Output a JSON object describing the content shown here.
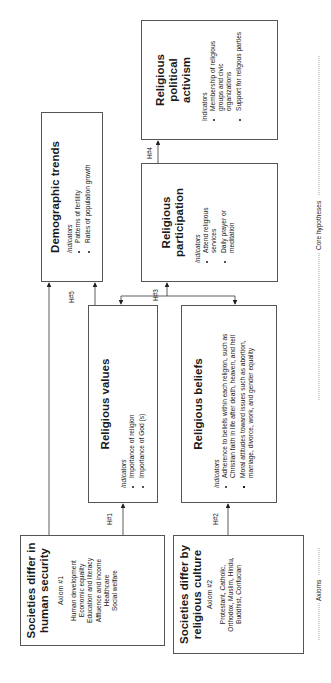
{
  "axioms": [
    {
      "id": "axiom-1",
      "title": "Societies differ in human security",
      "subtitle": "Axiom #1",
      "items": [
        "Human development",
        "Economic equality",
        "Education and literacy",
        "Affluence and income",
        "Healthcare",
        "Social welfare"
      ]
    },
    {
      "id": "axiom-2",
      "title": "Societies differ by religious culture",
      "subtitle": "Axiom #2",
      "items_text": "Protestant, Catholic, Orthodox, Muslim, Hindu, Buddhist, Confucian"
    }
  ],
  "boxes": {
    "religious_values": {
      "title": "Religious values",
      "indicators_label": "Indicators",
      "items": [
        "Importance of religion",
        "Importance of God (s)"
      ]
    },
    "religious_beliefs": {
      "title": "Religious beliefs",
      "indicators_label": "Indicators",
      "items": [
        "Adherence to beliefs within each religion, such as Christian faith in life after death, heaven, and hell",
        "Moral attitudes toward issues such as abortion, marriage, divorce, work, and gender equality"
      ]
    },
    "demographic_trends": {
      "title": "Demographic trends",
      "indicators_label": "Indicators",
      "items": [
        "Patterns of fertility",
        "Rates of population growth"
      ]
    },
    "religious_participation": {
      "title": "Religious participation",
      "indicators_label": "Indicators",
      "items": [
        "Attend religious services",
        "Daily prayer or meditation"
      ]
    },
    "religious_political_activism": {
      "title": "Religious political activism",
      "indicators_label": "Indicators",
      "items": [
        "Membership of religious groups and civic organizations",
        "Support for religous parties"
      ]
    }
  },
  "hypotheses": {
    "h1": "H#1",
    "h2": "H#2",
    "h3": "H#3",
    "h4": "H#4",
    "h5": "H#5"
  },
  "section_labels": {
    "axioms": "Axioms",
    "core_hypotheses": "Core hypotheses"
  },
  "colors": {
    "line": "#333333",
    "border": "#555555",
    "text": "#1a1a1a"
  }
}
